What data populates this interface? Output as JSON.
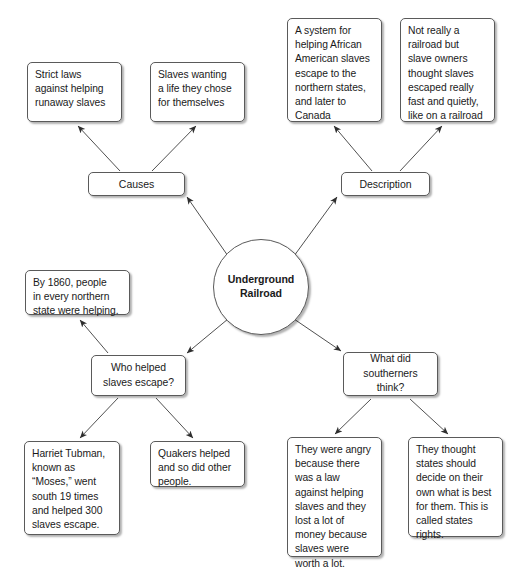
{
  "diagram": {
    "center": {
      "id": "center",
      "label": "Underground\nRailroad"
    },
    "branches": [
      {
        "id": "causes",
        "label": "Causes",
        "children": [
          {
            "id": "causes-1",
            "text": "Strict laws\nagainst helping\nrunaway slaves"
          },
          {
            "id": "causes-2",
            "text": "Slaves wanting\na life they chose\nfor themselves"
          }
        ]
      },
      {
        "id": "description",
        "label": "Description",
        "children": [
          {
            "id": "description-1",
            "text": "A system for\nhelping African\nAmerican slaves\nescape to the\nnorthern states,\nand later to\nCanada"
          },
          {
            "id": "description-2",
            "text": "Not really a\nrailroad but\nslave owners\nthought slaves\nescaped really\nfast and quietly,\nlike on a railroad"
          }
        ]
      },
      {
        "id": "who-helped",
        "label": "Who helped\nslaves escape?",
        "children": [
          {
            "id": "who-helped-0",
            "text": "By 1860, people\nin every northern\nstate were helping."
          },
          {
            "id": "who-helped-1",
            "text": "Harriet Tubman,\nknown as\n“Moses,” went\nsouth 19 times\nand helped 300\nslaves escape."
          },
          {
            "id": "who-helped-2",
            "text": "Quakers helped\nand so did other\npeople."
          }
        ]
      },
      {
        "id": "southerners",
        "label": "What did\nsoutherners\nthink?",
        "children": [
          {
            "id": "southerners-1",
            "text": "They were angry\nbecause there\nwas a law\nagainst helping\nslaves and they\nlost a lot of\nmoney because\nslaves were\nworth a lot."
          },
          {
            "id": "southerners-2",
            "text": "They thought\nstates should\ndecide on their\nown what is best\nfor them. This is\ncalled states\nrights."
          }
        ]
      }
    ],
    "style": {
      "node_border": "#5a5a5a",
      "node_fill": "#ffffff",
      "edge_color": "#3c3c3c",
      "text_color": "#1a1a1a",
      "background": "#ffffff"
    }
  }
}
